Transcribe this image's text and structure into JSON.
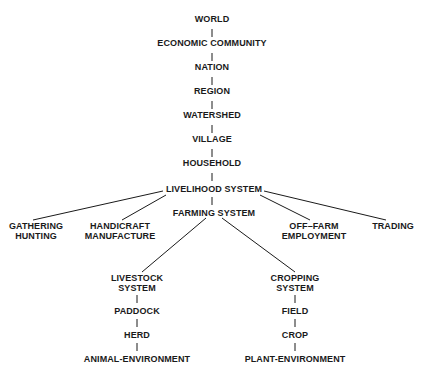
{
  "diagram": {
    "type": "hierarchy",
    "chain": [
      "WORLD",
      "ECONOMIC COMMUNITY",
      "NATION",
      "REGION",
      "WATERSHED",
      "VILLAGE",
      "HOUSEHOLD",
      "LIVELIHOOD SYSTEM"
    ],
    "livelihood_children": {
      "gathering": [
        "GATHERING",
        "HUNTING"
      ],
      "handicraft": [
        "HANDICRAFT",
        "MANUFACTURE"
      ],
      "farming": "FARMING SYSTEM",
      "offfarm": [
        "OFF–FARM",
        "EMPLOYMENT"
      ],
      "trading": "TRADING"
    },
    "livestock": [
      "LIVESTOCK",
      "SYSTEM"
    ],
    "livestock_chain": [
      "PADDOCK",
      "HERD",
      "ANIMAL-ENVIRONMENT"
    ],
    "cropping": [
      "CROPPING",
      "SYSTEM"
    ],
    "cropping_chain": [
      "FIELD",
      "CROP",
      "PLANT-ENVIRONMENT"
    ]
  }
}
